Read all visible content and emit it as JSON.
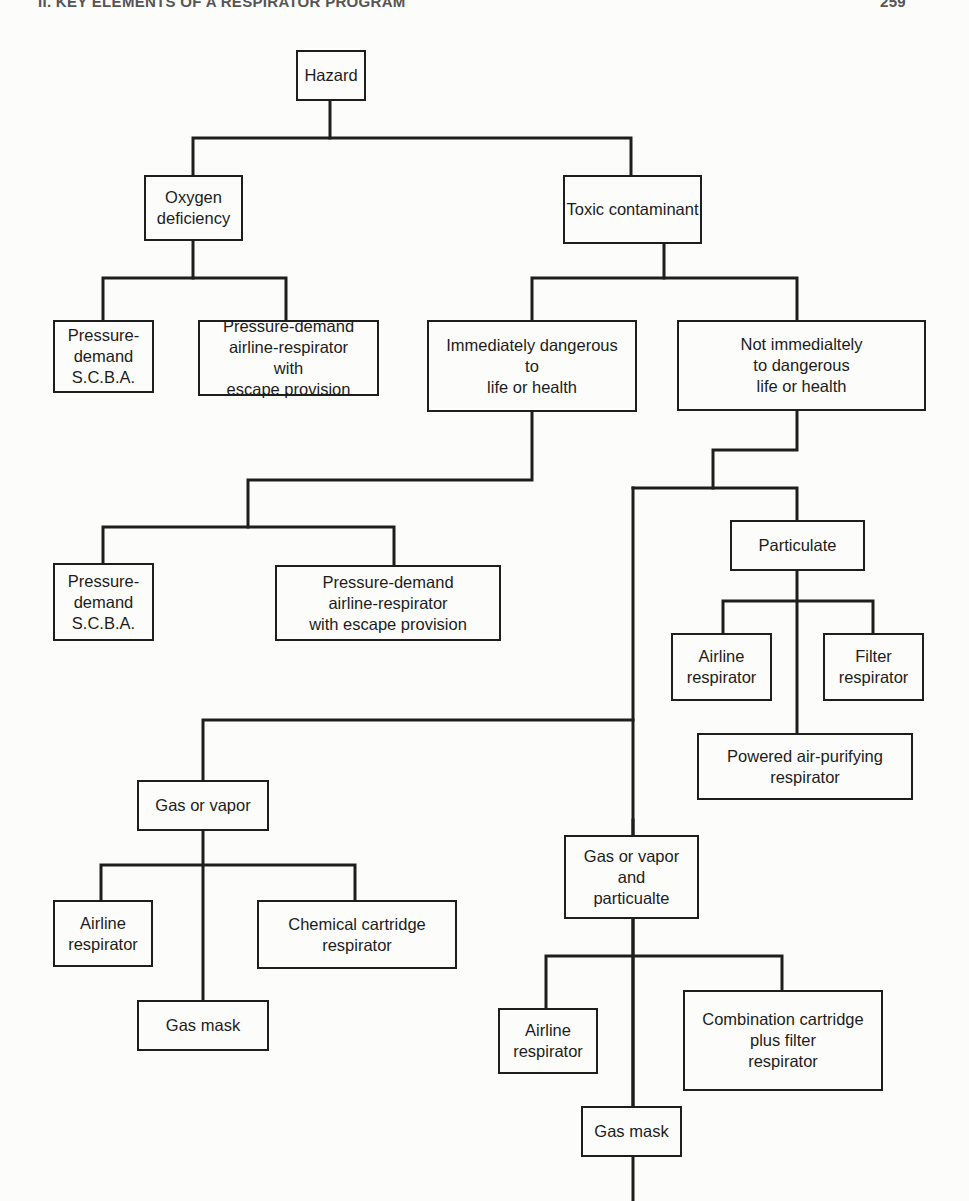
{
  "page_header": {
    "running_title": "II. KEY ELEMENTS OF A RESPIRATOR PROGRAM",
    "page_number": "259"
  },
  "diagram": {
    "type": "decision-tree",
    "nodes": {
      "hazard": "Hazard",
      "oxygen_deficiency": "Oxygen\ndeficiency",
      "toxic_contaminant": "Toxic contaminant",
      "o2_scba": "Pressure-\ndemand\nS.C.B.A.",
      "o2_airline": "Pressure-demand\nairline-respirator\nwith\nescape provision",
      "idlh": "Immediately dangerous\nto\nlife or health",
      "not_idlh": "Not immedialtely\nto dangerous\nlife or health",
      "idlh_scba": "Pressure-\ndemand\nS.C.B.A.",
      "idlh_airline": "Pressure-demand\nairline-respirator\nwith escape provision",
      "particulate": "Particulate",
      "part_airline": "Airline\nrespirator",
      "part_filter": "Filter\nrespirator",
      "part_papr": "Powered air-purifying\nrespirator",
      "gas_vapor": "Gas or vapor",
      "gv_airline": "Airline\nrespirator",
      "gv_chemical": "Chemical cartridge\nrespirator",
      "gv_gasmask": "Gas mask",
      "gvp": "Gas or vapor\nand\nparticualte",
      "gvp_airline": "Airline\nrespirator",
      "gvp_combo": "Combination cartridge\nplus filter\nrespirator",
      "gvp_gasmask": "Gas mask"
    },
    "edges": [
      [
        "hazard",
        "oxygen_deficiency"
      ],
      [
        "hazard",
        "toxic_contaminant"
      ],
      [
        "oxygen_deficiency",
        "o2_scba"
      ],
      [
        "oxygen_deficiency",
        "o2_airline"
      ],
      [
        "toxic_contaminant",
        "idlh"
      ],
      [
        "toxic_contaminant",
        "not_idlh"
      ],
      [
        "idlh",
        "idlh_scba"
      ],
      [
        "idlh",
        "idlh_airline"
      ],
      [
        "not_idlh",
        "particulate"
      ],
      [
        "not_idlh",
        "gas_vapor"
      ],
      [
        "not_idlh",
        "gvp"
      ],
      [
        "particulate",
        "part_airline"
      ],
      [
        "particulate",
        "part_filter"
      ],
      [
        "particulate",
        "part_papr"
      ],
      [
        "gas_vapor",
        "gv_airline"
      ],
      [
        "gas_vapor",
        "gv_chemical"
      ],
      [
        "gas_vapor",
        "gv_gasmask"
      ],
      [
        "gvp",
        "gvp_airline"
      ],
      [
        "gvp",
        "gvp_combo"
      ],
      [
        "gvp",
        "gvp_gasmask"
      ]
    ]
  },
  "colors": {
    "line": "#1e1e1e",
    "paper": "#fcfcfb",
    "header": "#555555"
  }
}
